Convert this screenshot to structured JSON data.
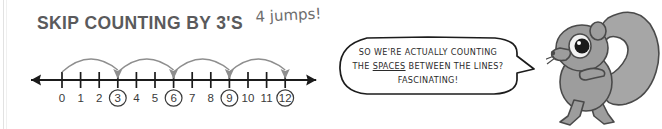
{
  "worksheet": {
    "title": "SKIP COUNTING BY 3'S",
    "handwritten_note": "4 jumps!",
    "ink_color": "#5a5a5c",
    "pencil_color": "#6d6d6d"
  },
  "number_line": {
    "min": 0,
    "max": 12,
    "tick_labels": [
      "0",
      "1",
      "2",
      "3",
      "4",
      "5",
      "6",
      "7",
      "8",
      "9",
      "10",
      "11",
      "12"
    ],
    "circled_values": [
      3,
      6,
      9,
      12
    ],
    "jumps": [
      {
        "from": 0,
        "to": 3
      },
      {
        "from": 3,
        "to": 6
      },
      {
        "from": 6,
        "to": 9
      },
      {
        "from": 9,
        "to": 12
      }
    ],
    "jump_size": 3,
    "jump_count": 4,
    "line_color": "#1b1b1b",
    "arc_color": "#8e8e8e",
    "label_color": "#3a3a3a",
    "left_arrow": true,
    "right_arrow": true
  },
  "speech_bubble": {
    "line1": "SO WE'RE ACTUALLY COUNTING",
    "line2_pre": "THE ",
    "line2_underlined": "SPACES",
    "line2_post": " BETWEEN THE LINES?",
    "line3": "FASCINATING!",
    "outline_color": "#1c1c1c",
    "fill_color": "#ffffff",
    "tail_direction": "right"
  },
  "squirrel": {
    "name": "squirrel-mascot",
    "body_color": "#9d9d9d",
    "tail_color": "#a6a6a6",
    "outline_color": "#4a4a4a",
    "eye_color": "#1a1a1a"
  }
}
